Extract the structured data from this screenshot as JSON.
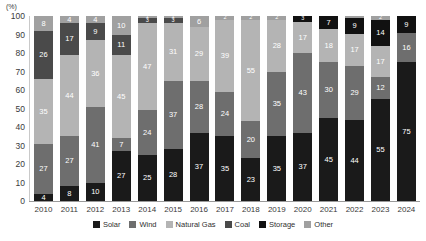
{
  "axis": {
    "unit_label": "(%)",
    "y_ticks": [
      "100",
      "90",
      "80",
      "70",
      "60",
      "50",
      "40",
      "30",
      "20",
      "10",
      "0"
    ],
    "y_min": 0,
    "y_max": 100
  },
  "legend": {
    "items": [
      {
        "label": "Solar",
        "color": "#1a1a1a"
      },
      {
        "label": "Wind",
        "color": "#6e6e6e"
      },
      {
        "label": "Natural Gas",
        "color": "#b4b4b4"
      },
      {
        "label": "Coal",
        "color": "#4a4a4a"
      },
      {
        "label": "Storage",
        "color": "#111111"
      },
      {
        "label": "Other",
        "color": "#a0a0a0"
      }
    ]
  },
  "chart_data": {
    "type": "bar",
    "stacked": true,
    "title": "",
    "xlabel": "",
    "ylabel": "(%)",
    "ylim": [
      0,
      100
    ],
    "grid": false,
    "legend_position": "bottom",
    "categories": [
      "2010",
      "2011",
      "2012",
      "2013",
      "2014",
      "2015",
      "2016",
      "2017",
      "2018",
      "2019",
      "2020",
      "2021",
      "2022",
      "2023",
      "2024"
    ],
    "series": [
      {
        "name": "Solar",
        "color": "#1a1a1a",
        "values": [
          4,
          8,
          10,
          27,
          25,
          28,
          37,
          35,
          23,
          35,
          37,
          45,
          44,
          55,
          75
        ]
      },
      {
        "name": "Wind",
        "color": "#6e6e6e",
        "values": [
          27,
          27,
          41,
          7,
          24,
          37,
          28,
          24,
          20,
          35,
          43,
          30,
          29,
          12,
          16
        ]
      },
      {
        "name": "Natural Gas",
        "color": "#b4b4b4",
        "values": [
          35,
          44,
          36,
          45,
          47,
          31,
          29,
          39,
          55,
          28,
          17,
          18,
          17,
          17,
          0
        ]
      },
      {
        "name": "Coal",
        "color": "#4a4a4a",
        "values": [
          26,
          17,
          9,
          11,
          3,
          3,
          0,
          0,
          0,
          0,
          0,
          0,
          0,
          0,
          0
        ]
      },
      {
        "name": "Storage",
        "color": "#111111",
        "values": [
          0,
          0,
          0,
          0,
          0,
          0,
          0,
          0,
          0,
          0,
          3,
          7,
          9,
          14,
          9
        ]
      },
      {
        "name": "Other",
        "color": "#a0a0a0",
        "values": [
          8,
          4,
          4,
          10,
          1,
          1,
          6,
          2,
          2,
          2,
          0,
          0,
          1,
          2,
          0
        ]
      }
    ],
    "bars": [
      {
        "year": "2010",
        "segments": [
          {
            "name": "Solar",
            "value": 4,
            "label": "4",
            "color": "#1a1a1a"
          },
          {
            "name": "Wind",
            "value": 27,
            "label": "27",
            "color": "#6e6e6e"
          },
          {
            "name": "Natural Gas",
            "value": 35,
            "label": "35",
            "color": "#b4b4b4"
          },
          {
            "name": "Coal",
            "value": 26,
            "label": "26",
            "color": "#4a4a4a"
          },
          {
            "name": "Other",
            "value": 8,
            "label": "8",
            "color": "#a0a0a0"
          }
        ]
      },
      {
        "year": "2011",
        "segments": [
          {
            "name": "Solar",
            "value": 8,
            "label": "8",
            "color": "#1a1a1a"
          },
          {
            "name": "Wind",
            "value": 27,
            "label": "27",
            "color": "#6e6e6e"
          },
          {
            "name": "Natural Gas",
            "value": 44,
            "label": "44",
            "color": "#b4b4b4"
          },
          {
            "name": "Coal",
            "value": 17,
            "label": "17",
            "color": "#4a4a4a"
          },
          {
            "name": "Other",
            "value": 4,
            "label": "4",
            "color": "#a0a0a0"
          }
        ]
      },
      {
        "year": "2012",
        "segments": [
          {
            "name": "Solar",
            "value": 10,
            "label": "10",
            "color": "#1a1a1a"
          },
          {
            "name": "Wind",
            "value": 41,
            "label": "41",
            "color": "#6e6e6e"
          },
          {
            "name": "Natural Gas",
            "value": 36,
            "label": "36",
            "color": "#b4b4b4"
          },
          {
            "name": "Coal",
            "value": 9,
            "label": "9",
            "color": "#4a4a4a"
          },
          {
            "name": "Other",
            "value": 4,
            "label": "4",
            "color": "#a0a0a0"
          }
        ]
      },
      {
        "year": "2013",
        "segments": [
          {
            "name": "Solar",
            "value": 27,
            "label": "27",
            "color": "#1a1a1a"
          },
          {
            "name": "Wind",
            "value": 7,
            "label": "7",
            "color": "#6e6e6e"
          },
          {
            "name": "Natural Gas",
            "value": 45,
            "label": "45",
            "color": "#b4b4b4"
          },
          {
            "name": "Coal",
            "value": 11,
            "label": "11",
            "color": "#4a4a4a"
          },
          {
            "name": "Other",
            "value": 10,
            "label": "10",
            "color": "#a0a0a0"
          }
        ]
      },
      {
        "year": "2014",
        "segments": [
          {
            "name": "Solar",
            "value": 25,
            "label": "25",
            "color": "#1a1a1a"
          },
          {
            "name": "Wind",
            "value": 24,
            "label": "24",
            "color": "#6e6e6e"
          },
          {
            "name": "Natural Gas",
            "value": 47,
            "label": "47",
            "color": "#b4b4b4"
          },
          {
            "name": "Coal",
            "value": 3,
            "label": "3",
            "color": "#4a4a4a"
          },
          {
            "name": "Other",
            "value": 1,
            "label": "1",
            "color": "#a0a0a0"
          }
        ]
      },
      {
        "year": "2015",
        "segments": [
          {
            "name": "Solar",
            "value": 28,
            "label": "28",
            "color": "#1a1a1a"
          },
          {
            "name": "Wind",
            "value": 37,
            "label": "37",
            "color": "#6e6e6e"
          },
          {
            "name": "Natural Gas",
            "value": 31,
            "label": "31",
            "color": "#b4b4b4"
          },
          {
            "name": "Coal",
            "value": 3,
            "label": "3",
            "color": "#4a4a4a"
          },
          {
            "name": "Other",
            "value": 1,
            "label": "1",
            "color": "#a0a0a0"
          }
        ]
      },
      {
        "year": "2016",
        "segments": [
          {
            "name": "Solar",
            "value": 37,
            "label": "37",
            "color": "#1a1a1a"
          },
          {
            "name": "Wind",
            "value": 28,
            "label": "28",
            "color": "#6e6e6e"
          },
          {
            "name": "Natural Gas",
            "value": 29,
            "label": "29",
            "color": "#b4b4b4"
          },
          {
            "name": "Other",
            "value": 6,
            "label": "6",
            "color": "#a0a0a0"
          }
        ]
      },
      {
        "year": "2017",
        "segments": [
          {
            "name": "Solar",
            "value": 35,
            "label": "35",
            "color": "#1a1a1a"
          },
          {
            "name": "Wind",
            "value": 24,
            "label": "24",
            "color": "#6e6e6e"
          },
          {
            "name": "Natural Gas",
            "value": 39,
            "label": "39",
            "color": "#b4b4b4"
          },
          {
            "name": "Other",
            "value": 2,
            "label": "2",
            "color": "#a0a0a0"
          }
        ]
      },
      {
        "year": "2018",
        "segments": [
          {
            "name": "Solar",
            "value": 23,
            "label": "23",
            "color": "#1a1a1a"
          },
          {
            "name": "Wind",
            "value": 20,
            "label": "20",
            "color": "#6e6e6e"
          },
          {
            "name": "Natural Gas",
            "value": 55,
            "label": "55",
            "color": "#b4b4b4"
          },
          {
            "name": "Other",
            "value": 2,
            "label": "2",
            "color": "#a0a0a0"
          }
        ]
      },
      {
        "year": "2019",
        "segments": [
          {
            "name": "Solar",
            "value": 35,
            "label": "35",
            "color": "#1a1a1a"
          },
          {
            "name": "Wind",
            "value": 35,
            "label": "35",
            "color": "#6e6e6e"
          },
          {
            "name": "Natural Gas",
            "value": 28,
            "label": "28",
            "color": "#b4b4b4"
          },
          {
            "name": "Other",
            "value": 2,
            "label": "2",
            "color": "#a0a0a0"
          }
        ]
      },
      {
        "year": "2020",
        "segments": [
          {
            "name": "Solar",
            "value": 37,
            "label": "37",
            "color": "#1a1a1a"
          },
          {
            "name": "Wind",
            "value": 43,
            "label": "43",
            "color": "#6e6e6e"
          },
          {
            "name": "Natural Gas",
            "value": 17,
            "label": "17",
            "color": "#b4b4b4"
          },
          {
            "name": "Storage",
            "value": 3,
            "label": "3",
            "color": "#111111"
          }
        ]
      },
      {
        "year": "2021",
        "segments": [
          {
            "name": "Solar",
            "value": 45,
            "label": "45",
            "color": "#1a1a1a"
          },
          {
            "name": "Wind",
            "value": 30,
            "label": "30",
            "color": "#6e6e6e"
          },
          {
            "name": "Natural Gas",
            "value": 18,
            "label": "18",
            "color": "#b4b4b4"
          },
          {
            "name": "Storage",
            "value": 7,
            "label": "7",
            "color": "#111111"
          }
        ]
      },
      {
        "year": "2022",
        "segments": [
          {
            "name": "Solar",
            "value": 44,
            "label": "44",
            "color": "#1a1a1a"
          },
          {
            "name": "Wind",
            "value": 29,
            "label": "29",
            "color": "#6e6e6e"
          },
          {
            "name": "Natural Gas",
            "value": 17,
            "label": "17",
            "color": "#b4b4b4"
          },
          {
            "name": "Storage",
            "value": 9,
            "label": "9",
            "color": "#111111"
          },
          {
            "name": "Other",
            "value": 1,
            "label": "",
            "color": "#a0a0a0"
          }
        ]
      },
      {
        "year": "2023",
        "segments": [
          {
            "name": "Solar",
            "value": 55,
            "label": "55",
            "color": "#1a1a1a"
          },
          {
            "name": "Wind",
            "value": 12,
            "label": "12",
            "color": "#6e6e6e"
          },
          {
            "name": "Natural Gas",
            "value": 17,
            "label": "17",
            "color": "#b4b4b4"
          },
          {
            "name": "Storage",
            "value": 14,
            "label": "14",
            "color": "#111111"
          },
          {
            "name": "Other",
            "value": 2,
            "label": "2",
            "color": "#a0a0a0"
          }
        ]
      },
      {
        "year": "2024",
        "segments": [
          {
            "name": "Solar",
            "value": 75,
            "label": "75",
            "color": "#1a1a1a"
          },
          {
            "name": "Wind",
            "value": 16,
            "label": "16",
            "color": "#6e6e6e"
          },
          {
            "name": "Storage",
            "value": 9,
            "label": "9",
            "color": "#111111"
          }
        ]
      }
    ]
  }
}
